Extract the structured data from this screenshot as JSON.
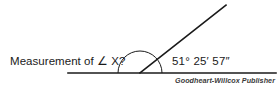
{
  "figure": {
    "type": "geometry-angle-diagram",
    "question_label": "Measurement of ∠ X?",
    "angle_value": "51° 25′ 57″",
    "credit": "Goodheart-Willcox Publisher",
    "background_color": "#ffffff",
    "stroke_color": "#1a1a1a",
    "text_color": "#1a1a1a"
  },
  "geometry": {
    "baseline": {
      "name": "horizontal-ray",
      "x1": 68,
      "y1": 73,
      "x2": 276,
      "y2": 73,
      "stroke_width": 1.6
    },
    "slanted_ray": {
      "name": "angled-ray",
      "x1": 140,
      "y1": 73,
      "x2": 226,
      "y2": 5,
      "stroke_width": 1.6
    },
    "vertex": {
      "x": 140,
      "y": 73
    },
    "arc": {
      "name": "protractor-semicircle",
      "center_x": 140,
      "center_y": 73,
      "radius": 22,
      "start_angle_deg": 0,
      "end_angle_deg": 180,
      "stroke_width": 1.0
    }
  },
  "chart_data": {
    "type": "diagram",
    "title": "Measurement of ∠ X?",
    "annotations": [
      "Measurement of ∠ X?",
      "51° 25′ 57″",
      "Goodheart-Willcox Publisher"
    ],
    "angle_degrees": 51,
    "angle_minutes": 25,
    "angle_seconds": 57,
    "angle_decimal_degrees": 51.4325
  }
}
